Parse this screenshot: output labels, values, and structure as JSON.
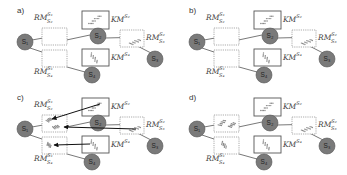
{
  "figure": {
    "panels": [
      {
        "id": "a",
        "label": "a)",
        "nodes": [
          "S1",
          "S2",
          "S3",
          "S4"
        ],
        "km_boxes": [
          {
            "id": "KM_S2",
            "base": "KM",
            "sup": "S2",
            "has_scatter": true
          },
          {
            "id": "KM_S4",
            "base": "KM",
            "sup": "S4",
            "has_scatter": true
          }
        ],
        "rm_boxes": [
          {
            "id": "RM_S2_S1",
            "base": "RM",
            "sup": "S1",
            "sub": "S2",
            "has_scatter": false
          },
          {
            "id": "RM_S4_S1",
            "base": "RM",
            "sup": "S1",
            "sub": "S4",
            "has_scatter": false
          },
          {
            "id": "RM_S3_S2",
            "base": "RM",
            "sup": "S2",
            "sub": "S3",
            "has_scatter": true
          }
        ],
        "arrows": false
      },
      {
        "id": "b",
        "label": "b)",
        "nodes": [
          "S1",
          "S2",
          "S3",
          "S4"
        ],
        "km_boxes": [
          {
            "id": "KM_S2",
            "base": "KM",
            "sup": "S2",
            "has_scatter": true
          },
          {
            "id": "KM_S4",
            "base": "KM",
            "sup": "S4",
            "has_scatter": true
          }
        ],
        "rm_boxes": [
          {
            "id": "RM_S2_S1",
            "base": "RM",
            "sup": "S1",
            "sub": "S2",
            "has_scatter": false
          },
          {
            "id": "RM_S4_S1",
            "base": "RM",
            "sup": "S1",
            "sub": "S4",
            "has_scatter": false
          },
          {
            "id": "RM_S3_S2",
            "base": "RM",
            "sup": "S2",
            "sub": "S3",
            "has_scatter": true
          }
        ],
        "arrows": false
      },
      {
        "id": "c",
        "label": "c)",
        "nodes": [
          "S1",
          "S2",
          "S3",
          "S4"
        ],
        "km_boxes": [
          {
            "id": "KM_S2",
            "base": "KM",
            "sup": "S2",
            "has_scatter": true
          },
          {
            "id": "KM_S4",
            "base": "KM",
            "sup": "S4",
            "has_scatter": true
          }
        ],
        "rm_boxes": [
          {
            "id": "RM_S2_S1",
            "base": "RM",
            "sup": "S1",
            "sub": "S2",
            "has_scatter": true
          },
          {
            "id": "RM_S4_S1",
            "base": "RM",
            "sup": "S1",
            "sub": "S4",
            "has_scatter": true
          },
          {
            "id": "RM_S3_S2",
            "base": "RM",
            "sup": "S2",
            "sub": "S3",
            "has_scatter": true
          }
        ],
        "arrows": true
      },
      {
        "id": "d",
        "label": "d)",
        "nodes": [
          "S1",
          "S2",
          "S3",
          "S4"
        ],
        "km_boxes": [
          {
            "id": "KM_S2",
            "base": "KM",
            "sup": "S2",
            "has_scatter": true
          },
          {
            "id": "KM_S4",
            "base": "KM",
            "sup": "S4",
            "has_scatter": true
          }
        ],
        "rm_boxes": [
          {
            "id": "RM_S2_S1",
            "base": "RM",
            "sup": "S1",
            "sub": "S2",
            "has_scatter": true,
            "hidden_label": true
          },
          {
            "id": "RM_S4_S1",
            "base": "RM",
            "sup": "S1",
            "sub": "S4",
            "has_scatter": true
          },
          {
            "id": "RM_S3_S2",
            "base": "RM",
            "sup": "S2",
            "sub": "S3",
            "has_scatter": true
          }
        ],
        "arrows": false
      }
    ],
    "colors": {
      "node_fill": "#7a7a7a",
      "node_stroke": "#555555",
      "line": "#555555",
      "km_box_stroke": "#555555",
      "rm_box_stroke": "#888888",
      "scatter": "#8a8a8a",
      "arrow": "#111111"
    }
  }
}
